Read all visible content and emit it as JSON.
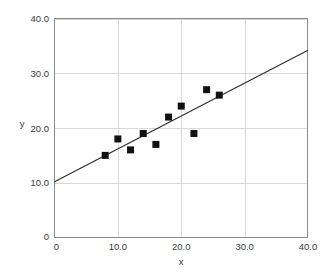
{
  "chart_data": {
    "type": "scatter",
    "title": "",
    "xlabel": "x",
    "ylabel": "y",
    "xlim": [
      0,
      40
    ],
    "ylim": [
      0,
      40
    ],
    "xticks": [
      0,
      10,
      20,
      30,
      40
    ],
    "yticks": [
      0,
      10,
      20,
      30,
      40
    ],
    "xtick_labels": [
      "0",
      "10.0",
      "20.0",
      "30.0",
      "40.0"
    ],
    "ytick_labels": [
      "0",
      "10.0",
      "20.0",
      "30.0",
      "40.0"
    ],
    "grid": true,
    "grid_color": "#d8d8d8",
    "legend": "none",
    "marker_shape": "square",
    "marker_color": "#111111",
    "marker_size": 7,
    "points": [
      {
        "x": 8,
        "y": 15
      },
      {
        "x": 10,
        "y": 18
      },
      {
        "x": 12,
        "y": 16
      },
      {
        "x": 14,
        "y": 19
      },
      {
        "x": 16,
        "y": 17
      },
      {
        "x": 18,
        "y": 22
      },
      {
        "x": 20,
        "y": 24
      },
      {
        "x": 22,
        "y": 19
      },
      {
        "x": 24,
        "y": 27
      },
      {
        "x": 26,
        "y": 26
      }
    ],
    "series": [
      {
        "name": "observations",
        "type": "scatter",
        "x": [
          8,
          10,
          12,
          14,
          16,
          18,
          20,
          22,
          24,
          26
        ],
        "values": [
          15,
          18,
          16,
          19,
          17,
          22,
          24,
          19,
          27,
          26
        ]
      },
      {
        "name": "regression-line",
        "type": "line",
        "color": "#2b2b2b",
        "slope": 0.6,
        "intercept": 10.2,
        "x": [
          0,
          40
        ],
        "values": [
          10.2,
          34.2
        ]
      }
    ]
  },
  "axes": {
    "x_title": "x",
    "y_title": "y",
    "y_zero_label": "0",
    "x_zero_label": "0"
  }
}
